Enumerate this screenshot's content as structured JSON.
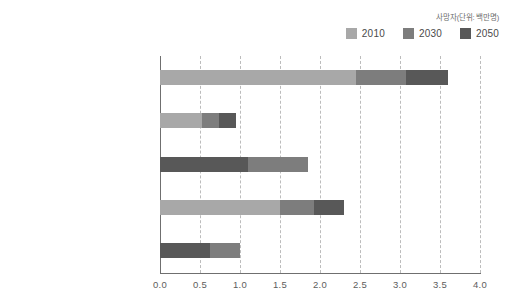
{
  "chart_data": {
    "type": "bar",
    "orientation": "horizontal",
    "stacked": true,
    "title": "",
    "unit_label": "사망자(단위: 백만명)",
    "xlabel": "",
    "ylabel": "",
    "xlim": [
      0.0,
      4.0
    ],
    "xticks": [
      "0.0",
      "0.5",
      "1.0",
      "1.5",
      "2.0",
      "2.5",
      "3.0",
      "3.5",
      "4.0"
    ],
    "grid": true,
    "legend_position": "top-right",
    "categories": [
      "미세먼지",
      "지상오존",
      "안전하지 않은 물 공급과 위생",
      "실내 공기 오염",
      "말라리아"
    ],
    "series": [
      {
        "name": "2010",
        "color": "#a8a8a8",
        "values": [
          2.45,
          0.52,
          0.0,
          1.5,
          0.0
        ]
      },
      {
        "name": "2030",
        "color": "#7d7d7d",
        "values": [
          0.62,
          0.22,
          0.75,
          0.42,
          0.38
        ]
      },
      {
        "name": "2050",
        "color": "#585858",
        "values": [
          0.53,
          0.21,
          1.1,
          0.38,
          0.62
        ]
      }
    ],
    "totals": [
      3.6,
      0.95,
      1.85,
      2.3,
      1.0
    ],
    "segment_order": [
      [
        "2010",
        "2030",
        "2050"
      ],
      [
        "2010",
        "2030",
        "2050"
      ],
      [
        "2050",
        "2030",
        "2010"
      ],
      [
        "2010",
        "2030",
        "2050"
      ],
      [
        "2050",
        "2030",
        "2010"
      ]
    ]
  },
  "legend": {
    "items": [
      {
        "label": "2010",
        "color": "#a8a8a8"
      },
      {
        "label": "2030",
        "color": "#7d7d7d"
      },
      {
        "label": "2050",
        "color": "#585858"
      }
    ]
  },
  "axis": {
    "unit_label": "사망자(단위: 백만명)"
  }
}
